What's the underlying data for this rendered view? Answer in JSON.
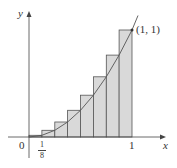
{
  "diagram": {
    "function": "y = x^2",
    "num_rectangles": 8,
    "rectangle_method": "right endpoints",
    "rect_fill": "#d9d9d9",
    "stroke": "#555555",
    "labels": {
      "y_axis": "y",
      "x_axis": "x",
      "origin": "0",
      "tick_one": "1",
      "tick_eighth_num": "1",
      "tick_eighth_den": "8",
      "point": "(1, 1)"
    }
  }
}
